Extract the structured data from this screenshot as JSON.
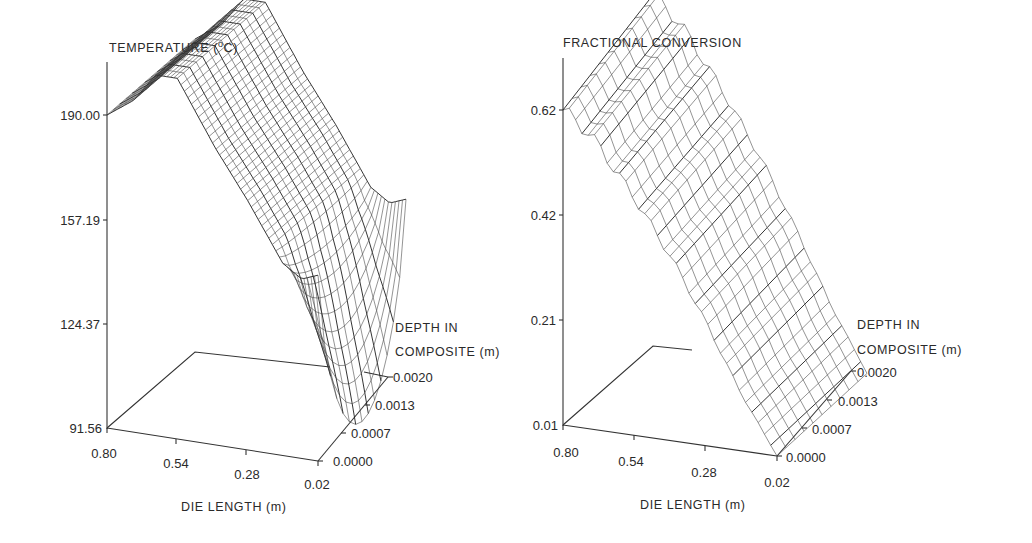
{
  "chart_data": [
    {
      "type": "surface-3d-wireframe",
      "title": "TEMPERATURE (°C)",
      "zlabel": "TEMPERATURE (°C)",
      "xlabel": "DIE LENGTH (m)",
      "ylabel": "DEPTH IN COMPOSITE (m)",
      "z_ticks": [
        "190.00",
        "157.19",
        "124.37",
        "91.56"
      ],
      "x_ticks": [
        "0.80",
        "0.54",
        "0.28",
        "0.02"
      ],
      "y_ticks": [
        "0.0020",
        "0.0013",
        "0.0007",
        "0.0000"
      ],
      "zlim": [
        91.56,
        190.0
      ],
      "xlim": [
        0.8,
        0.02
      ],
      "ylim": [
        0.0,
        0.002
      ],
      "description": "Temperature ~190°C near die entrance rising slightly, then decreasing along die length to ~145°C; near die exit the surface dips sharply at the composite center to ~92°C while surface stays ~150°C",
      "profile_along_length_surface": {
        "x": [
          0.8,
          0.7,
          0.62,
          0.54,
          0.4,
          0.28,
          0.15,
          0.08,
          0.02
        ],
        "z": [
          190,
          196,
          205,
          205,
          185,
          170,
          152,
          148,
          150
        ]
      },
      "profile_center_min": {
        "x": [
          0.8,
          0.54,
          0.28,
          0.1,
          0.02
        ],
        "z": [
          190,
          200,
          165,
          140,
          92
        ]
      }
    },
    {
      "type": "surface-3d-wireframe",
      "title": "FRACTIONAL CONVERSION",
      "zlabel": "FRACTIONAL CONVERSION",
      "xlabel": "DIE LENGTH (m)",
      "ylabel": "DEPTH IN COMPOSITE (m)",
      "z_ticks": [
        "0.62",
        "0.42",
        "0.21",
        "0.01"
      ],
      "x_ticks": [
        "0.80",
        "0.54",
        "0.28",
        "0.02"
      ],
      "y_ticks": [
        "0.0020",
        "0.0013",
        "0.0007",
        "0.0000"
      ],
      "zlim": [
        0.01,
        0.62
      ],
      "xlim": [
        0.8,
        0.02
      ],
      "ylim": [
        0.0,
        0.002
      ],
      "description": "Fractional conversion ~0.62-0.70 at die entrance decreasing monotonically to ~0.01 at die exit; slight curvature across depth",
      "profile_along_length": {
        "x": [
          0.8,
          0.7,
          0.54,
          0.4,
          0.28,
          0.15,
          0.02
        ],
        "z": [
          0.62,
          0.58,
          0.47,
          0.36,
          0.25,
          0.12,
          0.01
        ]
      }
    }
  ],
  "left": {
    "title_main": "TEMPERATURE (",
    "title_sup": "o",
    "title_end": "C)",
    "z_ticks": [
      "190.00",
      "157.19",
      "124.37",
      "91.56"
    ],
    "x_ticks": [
      "0.80",
      "0.54",
      "0.28",
      "0.02"
    ],
    "y_ticks": [
      "0.0020",
      "0.0013",
      "0.0007",
      "0.0000"
    ],
    "xlabel": "DIE LENGTH (m)",
    "ylabel_1": "DEPTH IN",
    "ylabel_2": "COMPOSITE (m)"
  },
  "right": {
    "title": "FRACTIONAL CONVERSION",
    "z_ticks": [
      "0.62",
      "0.42",
      "0.21",
      "0.01"
    ],
    "x_ticks": [
      "0.80",
      "0.54",
      "0.28",
      "0.02"
    ],
    "y_ticks": [
      "0.0020",
      "0.0013",
      "0.0007",
      "0.0000"
    ],
    "xlabel": "DIE LENGTH (m)",
    "ylabel_1": "DEPTH IN",
    "ylabel_2": "COMPOSITE (m)"
  }
}
